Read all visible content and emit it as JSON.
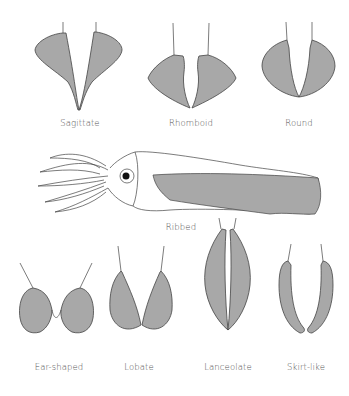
{
  "colors": {
    "fin_fill": "#a8a8a8",
    "outline": "#444444",
    "label": "#555555",
    "background": "#ffffff"
  },
  "shapes": [
    {
      "id": "sagittate",
      "label": "Sagittate"
    },
    {
      "id": "rhomboid",
      "label": "Rhomboid"
    },
    {
      "id": "round",
      "label": "Round"
    },
    {
      "id": "ribbed",
      "label": "Ribbed"
    },
    {
      "id": "ear-shaped",
      "label": "Ear-shaped"
    },
    {
      "id": "lobate",
      "label": "Lobate"
    },
    {
      "id": "lanceolate",
      "label": "Lanceolate"
    },
    {
      "id": "skirt-like",
      "label": "Skirt-like"
    }
  ]
}
